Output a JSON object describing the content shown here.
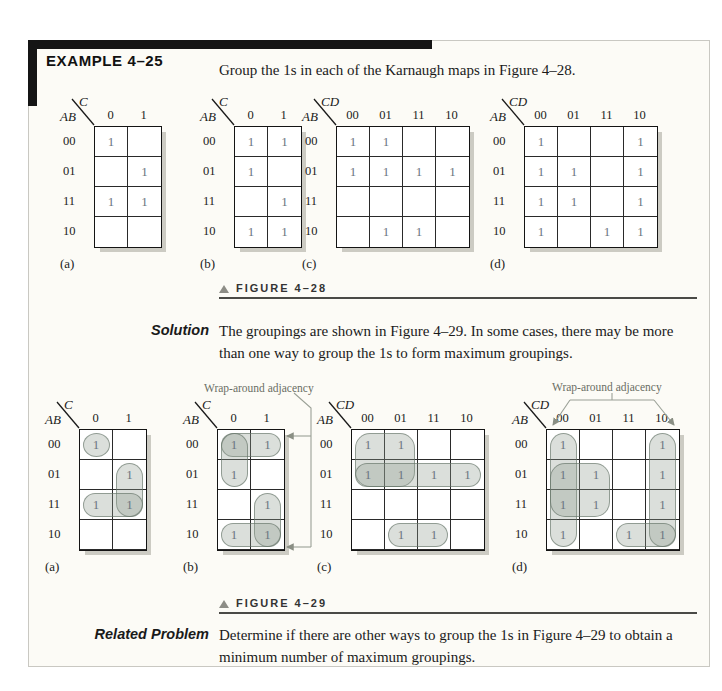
{
  "example": {
    "title": "EXAMPLE 4–25",
    "intro": "Group the 1s in each of the Karnaugh maps in Figure 4–28."
  },
  "figure28": {
    "caption": "FIGURE 4–28"
  },
  "solution": {
    "label": "Solution",
    "text": "The groupings are shown in Figure 4–29. In some cases, there may be more than one way to group the 1s to form maximum groupings."
  },
  "figure29": {
    "caption": "FIGURE 4–29",
    "wrap_label_b": "Wrap-around adjacency",
    "wrap_label_d": "Wrap-around adjacency"
  },
  "related": {
    "label": "Related Problem",
    "text": "Determine if there are other ways to group the 1s in Figure 4–29 to obtain a minimum number of maximum groupings."
  },
  "colors": {
    "group_fill": "rgba(142,156,143,0.32)",
    "group_border": "rgba(95,110,98,0.6)",
    "ones_text": "#6b7580",
    "shadow": "#cccbc3",
    "annotation_line": "#9aa096"
  },
  "maps": {
    "fig28a": {
      "label": "(a)",
      "top_var": "C",
      "side_var": "AB",
      "cols": [
        "0",
        "1"
      ],
      "rows": [
        "00",
        "01",
        "11",
        "10"
      ],
      "ones": [
        [
          1,
          0
        ],
        [
          0,
          1
        ],
        [
          1,
          1
        ],
        [
          0,
          0
        ]
      ]
    },
    "fig28b": {
      "label": "(b)",
      "top_var": "C",
      "side_var": "AB",
      "cols": [
        "0",
        "1"
      ],
      "rows": [
        "00",
        "01",
        "11",
        "10"
      ],
      "ones": [
        [
          1,
          1
        ],
        [
          1,
          0
        ],
        [
          0,
          1
        ],
        [
          1,
          1
        ]
      ]
    },
    "fig28c": {
      "label": "(c)",
      "top_var": "CD",
      "side_var": "AB",
      "cols": [
        "00",
        "01",
        "11",
        "10"
      ],
      "rows": [
        "00",
        "01",
        "11",
        "10"
      ],
      "ones": [
        [
          1,
          1,
          0,
          0
        ],
        [
          1,
          1,
          1,
          1
        ],
        [
          0,
          0,
          0,
          0
        ],
        [
          0,
          1,
          1,
          0
        ]
      ]
    },
    "fig28d": {
      "label": "(d)",
      "top_var": "CD",
      "side_var": "AB",
      "cols": [
        "00",
        "01",
        "11",
        "10"
      ],
      "rows": [
        "00",
        "01",
        "11",
        "10"
      ],
      "ones": [
        [
          1,
          0,
          0,
          1
        ],
        [
          1,
          1,
          0,
          1
        ],
        [
          1,
          1,
          0,
          1
        ],
        [
          1,
          0,
          1,
          1
        ]
      ]
    },
    "fig29a": {
      "label": "(a)",
      "top_var": "C",
      "side_var": "AB",
      "cols": [
        "0",
        "1"
      ],
      "rows": [
        "00",
        "01",
        "11",
        "10"
      ],
      "ones": [
        [
          1,
          0
        ],
        [
          0,
          1
        ],
        [
          1,
          1
        ],
        [
          0,
          0
        ]
      ],
      "groups": [
        {
          "r": 0,
          "c": 0,
          "rs": 1,
          "cs": 1
        },
        {
          "r": 1,
          "c": 1,
          "rs": 2,
          "cs": 1
        },
        {
          "r": 2,
          "c": 0,
          "rs": 1,
          "cs": 2
        }
      ]
    },
    "fig29b": {
      "label": "(b)",
      "top_var": "C",
      "side_var": "AB",
      "cols": [
        "0",
        "1"
      ],
      "rows": [
        "00",
        "01",
        "11",
        "10"
      ],
      "ones": [
        [
          1,
          1
        ],
        [
          1,
          0
        ],
        [
          0,
          1
        ],
        [
          1,
          1
        ]
      ],
      "groups": [
        {
          "r": 0,
          "c": 0,
          "rs": 1,
          "cs": 2
        },
        {
          "r": 0,
          "c": 0,
          "rs": 2,
          "cs": 1
        },
        {
          "r": 2,
          "c": 1,
          "rs": 2,
          "cs": 1
        },
        {
          "r": 3,
          "c": 0,
          "rs": 1,
          "cs": 2
        }
      ]
    },
    "fig29c": {
      "label": "(c)",
      "top_var": "CD",
      "side_var": "AB",
      "cols": [
        "00",
        "01",
        "11",
        "10"
      ],
      "rows": [
        "00",
        "01",
        "11",
        "10"
      ],
      "ones": [
        [
          1,
          1,
          0,
          0
        ],
        [
          1,
          1,
          1,
          1
        ],
        [
          0,
          0,
          0,
          0
        ],
        [
          0,
          1,
          1,
          0
        ]
      ],
      "groups": [
        {
          "r": 0,
          "c": 0,
          "rs": 2,
          "cs": 2
        },
        {
          "r": 1,
          "c": 0,
          "rs": 1,
          "cs": 4
        },
        {
          "r": 3,
          "c": 1,
          "rs": 1,
          "cs": 2
        }
      ]
    },
    "fig29d": {
      "label": "(d)",
      "top_var": "CD",
      "side_var": "AB",
      "cols": [
        "00",
        "01",
        "11",
        "10"
      ],
      "rows": [
        "00",
        "01",
        "11",
        "10"
      ],
      "ones": [
        [
          1,
          0,
          0,
          1
        ],
        [
          1,
          1,
          0,
          1
        ],
        [
          1,
          1,
          0,
          1
        ],
        [
          1,
          0,
          1,
          1
        ]
      ],
      "groups": [
        {
          "r": 0,
          "c": 0,
          "rs": 4,
          "cs": 1
        },
        {
          "r": 0,
          "c": 3,
          "rs": 4,
          "cs": 1
        },
        {
          "r": 1,
          "c": 0,
          "rs": 2,
          "cs": 2
        },
        {
          "r": 3,
          "c": 2,
          "rs": 1,
          "cs": 2
        }
      ]
    }
  }
}
